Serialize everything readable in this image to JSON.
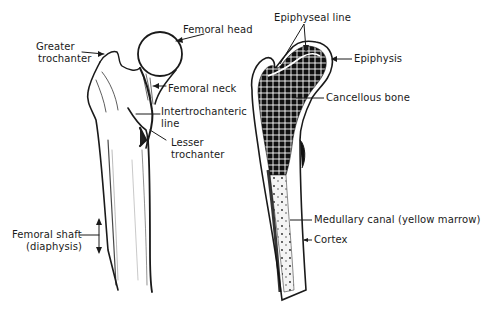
{
  "diagram": {
    "left_view": {
      "name": "External view of femur",
      "labels": {
        "greater_trochanter_1": "Greater",
        "greater_trochanter_2": "trochanter",
        "femoral_head": "Femoral head",
        "femoral_neck": "Femoral neck",
        "intertrochanteric_1": "Intertrochanteric",
        "intertrochanteric_2": "line",
        "lesser_trochanter_1": "Lesser",
        "lesser_trochanter_2": "trochanter",
        "femoral_shaft_1": "Femoral shaft",
        "femoral_shaft_2": "(diaphysis)"
      }
    },
    "right_view": {
      "name": "Longitudinal section of femur",
      "labels": {
        "epiphyseal_line": "Epiphyseal line",
        "epiphysis": "Epiphysis",
        "cancellous_bone": "Cancellous bone",
        "medullary_canal": "Medullary canal (yellow marrow)",
        "cortex": "Cortex"
      }
    },
    "colors": {
      "ink": "#1a1a1a",
      "background": "#ffffff"
    }
  }
}
